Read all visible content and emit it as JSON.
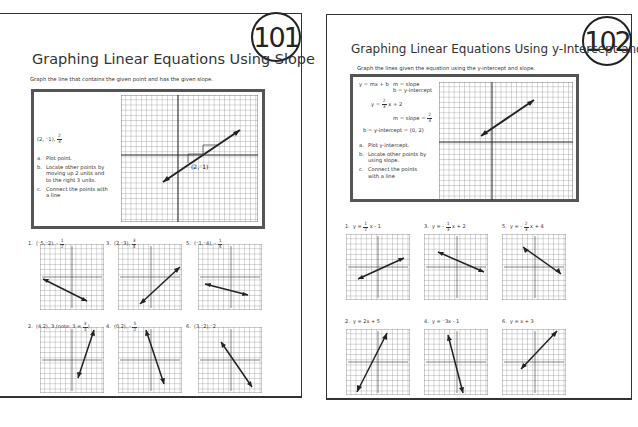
{
  "left_page": {
    "number": "101",
    "title": "Graphing Linear Equations Using Slope",
    "instruction": "Graph the line that contains the given point and has the given slope.",
    "example": {
      "point": "(2, ⁻1),",
      "slope_num": "2",
      "slope_den": "3",
      "steps": [
        {
          "letter": "a.",
          "text": "Plot point."
        },
        {
          "letter": "b.",
          "text": "Locate other points by moving up 2 units and to the right 3 units."
        },
        {
          "letter": "c.",
          "text": "Connect the points with a line"
        }
      ],
      "point_label": "(2,⁻1)"
    },
    "problems": [
      {
        "num": "1.",
        "text": "(⁻5,⁻2), -",
        "frac_num": "1",
        "frac_den": "2"
      },
      {
        "num": "3.",
        "text": "(2,⁻3),",
        "frac_num": "3",
        "frac_den": "4"
      },
      {
        "num": "5.",
        "text": "(⁻1,⁻4), -",
        "frac_num": "1",
        "frac_den": "4"
      },
      {
        "num": "2.",
        "text": "(4,2), 3  (note: 3 =",
        "frac_num": "3",
        "frac_den": "1",
        "suffix": ")"
      },
      {
        "num": "4.",
        "text": "(0,2), -",
        "frac_num": "5",
        "frac_den": "2"
      },
      {
        "num": "6.",
        "text": "(3,⁻2),⁻2"
      }
    ]
  },
  "right_page": {
    "number": "102",
    "title": "Graphing Linear Equations Using y-Intercept and",
    "instruction": "Graph the lines given the equation using the y-intercept and slope.",
    "example": {
      "form": "y = mx + b",
      "m_def": "m = slope",
      "b_def": "b = y-intercept",
      "eq_pre": "y =",
      "eq_num": "2",
      "eq_den": "3",
      "eq_post": "x + 2",
      "slope_pre": "m = slope =",
      "slope_num": "2",
      "slope_den": "3",
      "intercept": "b = y-intercept = (0, 2)",
      "steps": [
        {
          "letter": "a.",
          "text": "Plot y-intercept."
        },
        {
          "letter": "b.",
          "text": "Locate other points by using slope."
        },
        {
          "letter": "c.",
          "text": "Connect the points with a line"
        }
      ]
    },
    "problems": [
      {
        "num": "1.",
        "pre": "y =",
        "frac_num": "1",
        "frac_den": "2",
        "post": "x - 1"
      },
      {
        "num": "3.",
        "pre": "y = -",
        "frac_num": "1",
        "frac_den": "3",
        "post": "x + 2"
      },
      {
        "num": "5.",
        "pre": "y = -",
        "frac_num": "2",
        "frac_den": "3",
        "post": "x + 4"
      },
      {
        "num": "2.",
        "pre": "y = 2x + 5"
      },
      {
        "num": "4.",
        "pre": "y = ⁻3x - 1"
      },
      {
        "num": "6.",
        "pre": "y = x + 3"
      }
    ]
  }
}
